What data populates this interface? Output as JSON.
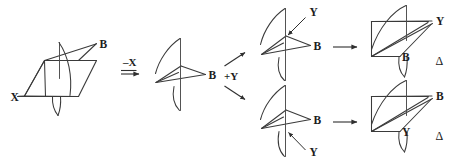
{
  "diagram": {
    "type": "reaction-scheme",
    "background_color": "#ffffff",
    "line_color": "#3a3a3a",
    "text_color": "#1c1c1c"
  },
  "steps": [
    {
      "id": "reactant",
      "role": "starting-material",
      "description": "Tetrahedral stereocenter bearing X and B substituents",
      "labels": [
        {
          "text": "X",
          "position": "lower-left"
        },
        {
          "text": "B",
          "position": "upper-right"
        }
      ]
    },
    {
      "id": "intermediate",
      "role": "carbocation",
      "description": "Planar trigonal carbocation with empty p orbital",
      "labels": [
        {
          "text": "B",
          "position": "right"
        }
      ]
    },
    {
      "id": "product-top",
      "role": "product",
      "description": "Product from top-face attack by Y",
      "labels": [
        {
          "text": "Y",
          "position": "upper-right"
        },
        {
          "text": "B",
          "position": "lower-right"
        }
      ],
      "annotation": "Δ"
    },
    {
      "id": "product-bottom",
      "role": "product",
      "description": "Enantiomeric product from bottom-face attack by Y",
      "labels": [
        {
          "text": "B",
          "position": "upper-right"
        },
        {
          "text": "Y",
          "position": "lower-right"
        }
      ],
      "annotation": "Δ"
    }
  ],
  "reaction_arrows": [
    {
      "id": "loss-of-x",
      "label": "–X",
      "direction": "right"
    },
    {
      "id": "addition-of-y",
      "label": "+Y",
      "direction": "branching"
    },
    {
      "id": "to-product-top",
      "label": "",
      "direction": "right"
    },
    {
      "id": "to-product-bottom",
      "label": "",
      "direction": "right"
    }
  ],
  "labels": {
    "x": "X",
    "b": "B",
    "y": "Y",
    "minus_x": "–X",
    "plus_y": "+Y",
    "delta": "Δ"
  },
  "attack_arrows": [
    {
      "id": "y-top-attack",
      "label": "Y",
      "from": "upper-right",
      "to": "carbon-top-face"
    },
    {
      "id": "y-bottom-attack",
      "label": "Y",
      "from": "lower-right",
      "to": "carbon-bottom-face"
    }
  ]
}
